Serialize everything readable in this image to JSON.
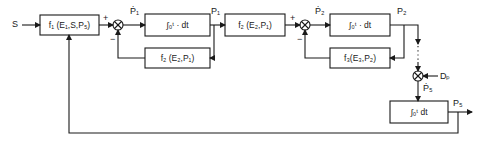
{
  "diagram": {
    "type": "block-diagram",
    "input": {
      "label": "S"
    },
    "blocks": [
      {
        "id": "f1",
        "label": "f₁ (E₁,S,P₅)"
      },
      {
        "id": "int1",
        "label": "∫₀ᵗ · dt"
      },
      {
        "id": "fb1",
        "label": "f₂ (E₂,P₁)"
      },
      {
        "id": "f2",
        "label": "f₂ (E₂,P₁)"
      },
      {
        "id": "int2",
        "label": "∫₀ᵗ · dt"
      },
      {
        "id": "fb2",
        "label": "f₃(E₃,P₂)"
      },
      {
        "id": "int3",
        "label": "∫₀ᵗ dt"
      }
    ],
    "signals": {
      "p1dot": "Ṗ₁",
      "p1": "P₁",
      "p2dot": "Ṗ₂",
      "p2": "P₂",
      "dp": "Dₚ",
      "p5dot": "Ṗ₅",
      "p5": "P₅"
    },
    "signs": {
      "j1_plus": "+",
      "j1_minus": "−",
      "j2_plus": "+",
      "j2_minus": "−"
    },
    "colors": {
      "line": "#1a1a1a",
      "background": "#ffffff"
    }
  }
}
